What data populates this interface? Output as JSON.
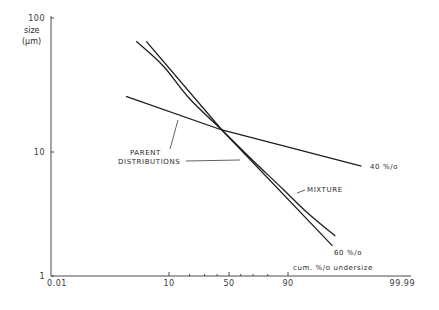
{
  "chart_data": {
    "type": "line",
    "title": "",
    "xlabel": "cum. %/o undersize",
    "ylabel_line1": "size",
    "ylabel_line2": "(µm)",
    "xscale": "probability",
    "yscale": "log",
    "xlim": [
      0.01,
      99.99
    ],
    "ylim": [
      1,
      100
    ],
    "grid": false,
    "x_ticks": [
      {
        "value": 0.01,
        "label": "0.01",
        "major": true
      },
      {
        "value": 10,
        "label": "10",
        "major": true
      },
      {
        "value": 20,
        "label": "",
        "major": false
      },
      {
        "value": 30,
        "label": "",
        "major": false
      },
      {
        "value": 40,
        "label": "",
        "major": false
      },
      {
        "value": 50,
        "label": "50",
        "major": true
      },
      {
        "value": 60,
        "label": "",
        "major": false
      },
      {
        "value": 70,
        "label": "",
        "major": false
      },
      {
        "value": 80,
        "label": "",
        "major": false
      },
      {
        "value": 90,
        "label": "90",
        "major": true
      },
      {
        "value": 99.99,
        "label": "99.99",
        "major": true
      }
    ],
    "y_ticks": [
      {
        "value": 1,
        "label": "1"
      },
      {
        "value": 10,
        "label": "10"
      },
      {
        "value": 100,
        "label": "100"
      }
    ],
    "series": [
      {
        "name": "40 %/o",
        "role": "parent distribution",
        "points": [
          [
            1.5,
            26
          ],
          [
            44,
            14.6
          ],
          [
            99.7,
            7.7
          ]
        ]
      },
      {
        "name": "60 %/o",
        "role": "parent distribution",
        "points": [
          [
            4,
            67
          ],
          [
            44,
            14.6
          ],
          [
            98.5,
            1.75
          ]
        ]
      },
      {
        "name": "MIXTURE",
        "role": "mixture",
        "points": [
          [
            2.5,
            67
          ],
          [
            8,
            44
          ],
          [
            20,
            25
          ],
          [
            44,
            14.6
          ],
          [
            70,
            8.5
          ],
          [
            88,
            5
          ],
          [
            95,
            3.3
          ],
          [
            98.7,
            2.1
          ]
        ]
      }
    ],
    "annotations": [
      {
        "text_line1": "PARENT",
        "text_line2": "DISTRIBUTIONS",
        "points_to": [
          "40 %/o",
          "60 %/o"
        ]
      },
      {
        "text": "MIXTURE",
        "points_to": "MIXTURE"
      },
      {
        "text": "40 %/o",
        "labels": "40 %/o"
      },
      {
        "text": "60 %/o",
        "labels": "60 %/o"
      }
    ]
  }
}
